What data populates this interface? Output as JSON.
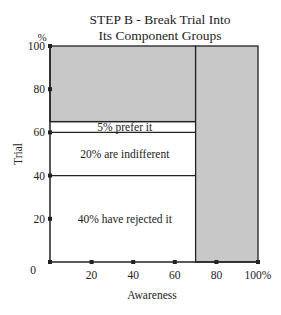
{
  "title_line1": "STEP B - Break Trial Into",
  "title_line2": "Its Component Groups",
  "chart_data": {
    "type": "bar",
    "xlabel": "Awareness",
    "ylabel": "Trial",
    "y_unit_label": "%",
    "xlim": [
      0,
      100
    ],
    "ylim": [
      0,
      100
    ],
    "x_ticks": [
      "0",
      "20",
      "40",
      "60",
      "80",
      "100%"
    ],
    "y_ticks": [
      "0",
      "20",
      "40",
      "60",
      "80",
      "100"
    ],
    "awareness_pct": 70,
    "trial_pct": 65,
    "segments": [
      {
        "label": "40% have rejected it",
        "from": 0,
        "to": 40,
        "value": 40
      },
      {
        "label": "20% are indifferent",
        "from": 40,
        "to": 60,
        "value": 20
      },
      {
        "label": "5% prefer it",
        "from": 60,
        "to": 65,
        "value": 5
      }
    ],
    "shaded_regions": [
      {
        "name": "non-trial among aware",
        "x": [
          0,
          70
        ],
        "y": [
          65,
          100
        ]
      },
      {
        "name": "unaware",
        "x": [
          70,
          100
        ],
        "y": [
          0,
          100
        ]
      }
    ],
    "colors": {
      "shade": "#c8c8c8",
      "line": "#222222",
      "background": "#ffffff"
    }
  }
}
